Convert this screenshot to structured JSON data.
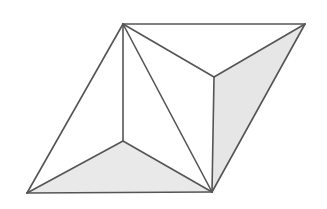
{
  "figure": {
    "kind": "line-drawing",
    "canvas": {
      "width": 327,
      "height": 209,
      "background": "#ffffff"
    },
    "style": {
      "edge_color": "#555555",
      "edge_width": "1.6",
      "shaded_face_color": "#e6e6e6",
      "shaded_face_color_alt": "#e9e9e9",
      "plain_face_color": "#ffffff"
    },
    "vertices": [
      {
        "id": "A",
        "label": "top-apex",
        "x": 123,
        "y": 24
      },
      {
        "id": "B",
        "label": "top-right",
        "x": 305,
        "y": 24
      },
      {
        "id": "C",
        "label": "bottom-left",
        "x": 27,
        "y": 193
      },
      {
        "id": "D",
        "label": "bottom-right",
        "x": 212,
        "y": 192
      },
      {
        "id": "E",
        "label": "interior-upper-right",
        "x": 214,
        "y": 77
      },
      {
        "id": "F",
        "label": "interior-lower-left",
        "x": 123,
        "y": 141
      }
    ],
    "faces": [
      {
        "id": "face-right-shaded",
        "points": "214,77 305,24 212,192",
        "fill": "#e6e6e6",
        "shaded": "true"
      },
      {
        "id": "face-bottom-shaded",
        "points": "27,193 123,141 212,192",
        "fill": "#e9e9e9",
        "shaded": "true"
      },
      {
        "id": "face-top-left",
        "points": "123,24 214,77 305,24",
        "fill": "#ffffff",
        "shaded": "false"
      },
      {
        "id": "face-center-right",
        "points": "123,24 214,77 212,192",
        "fill": "#ffffff",
        "shaded": "false"
      },
      {
        "id": "face-center-left",
        "points": "123,24 123,141 212,192",
        "fill": "#ffffff",
        "shaded": "false"
      },
      {
        "id": "face-left-upper",
        "points": "123,24 27,193 123,141",
        "fill": "#ffffff",
        "shaded": "false"
      }
    ],
    "edges": [
      {
        "id": "edge-A-B",
        "from": "A",
        "to": "B",
        "d": "M123,24 L305,24"
      },
      {
        "id": "edge-A-C",
        "from": "A",
        "to": "C",
        "d": "M123,24 L27,193"
      },
      {
        "id": "edge-A-E",
        "from": "A",
        "to": "E",
        "d": "M123,24 L214,77"
      },
      {
        "id": "edge-A-F",
        "from": "A",
        "to": "F",
        "d": "M123,24 L123,141"
      },
      {
        "id": "edge-A-D",
        "from": "A",
        "to": "D",
        "d": "M123,24 L212,192"
      },
      {
        "id": "edge-B-E",
        "from": "B",
        "to": "E",
        "d": "M305,24 L214,77"
      },
      {
        "id": "edge-B-D",
        "from": "B",
        "to": "D",
        "d": "M305,24 L212,192"
      },
      {
        "id": "edge-E-D",
        "from": "E",
        "to": "D",
        "d": "M214,77 L212,192"
      },
      {
        "id": "edge-C-F",
        "from": "C",
        "to": "F",
        "d": "M27,193 L123,141"
      },
      {
        "id": "edge-C-D",
        "from": "C",
        "to": "D",
        "d": "M27,193 L212,192"
      },
      {
        "id": "edge-F-D",
        "from": "F",
        "to": "D",
        "d": "M123,141 L212,192"
      }
    ]
  }
}
